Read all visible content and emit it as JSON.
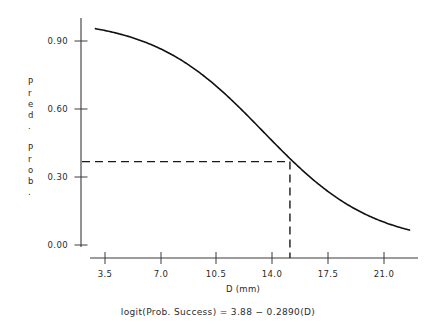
{
  "chart_data": {
    "type": "line",
    "title": "",
    "xlabel": "D  (mm)",
    "ylabel": "Pred. Prob.",
    "ylabel_chars": [
      "P",
      "r",
      "e",
      "d",
      ".",
      " ",
      "P",
      "r",
      "o",
      "b",
      "."
    ],
    "xlim": [
      2.1,
      23.2
    ],
    "ylim": [
      0.0,
      1.0
    ],
    "xticks": [
      3.5,
      7.0,
      10.5,
      14.0,
      17.5,
      21.0
    ],
    "xticklabels": [
      "3.5",
      "7.0",
      "10.5",
      "14.0",
      "17.5",
      "21.0"
    ],
    "yticks": [
      0.0,
      0.3,
      0.6,
      0.9
    ],
    "yticklabels": [
      "0.00",
      "0.30",
      "0.60",
      "0.90"
    ],
    "grid": false,
    "legend": "none",
    "model": {
      "intercept": 3.88,
      "slope": -0.289,
      "link": "logit"
    },
    "equation": "logit(Prob. Success)  =  3.88  −  0.2890(D)",
    "series": [
      {
        "name": "Predicted probability",
        "color": "#111111",
        "x": [
          2.9,
          3.5,
          4.5,
          5.5,
          6.5,
          7.5,
          8.5,
          9.5,
          10.5,
          11.5,
          12.5,
          13.5,
          14.0,
          15.1,
          16.0,
          17.0,
          18.0,
          19.0,
          20.0,
          21.0,
          22.0,
          22.6
        ],
        "y": [
          0.958,
          0.95,
          0.935,
          0.915,
          0.889,
          0.856,
          0.815,
          0.765,
          0.707,
          0.642,
          0.572,
          0.499,
          0.463,
          0.384,
          0.324,
          0.263,
          0.21,
          0.165,
          0.128,
          0.099,
          0.076,
          0.064
        ]
      }
    ],
    "reference_lines": {
      "color": "#1a1a1a",
      "style": "dashed",
      "horizontal_y": 0.368,
      "vertical_x": 15.1,
      "label": "intersection at predicted probability 0.368"
    }
  },
  "figure": {
    "background": "#ffffff",
    "axis_color": "#3a3a3a"
  }
}
